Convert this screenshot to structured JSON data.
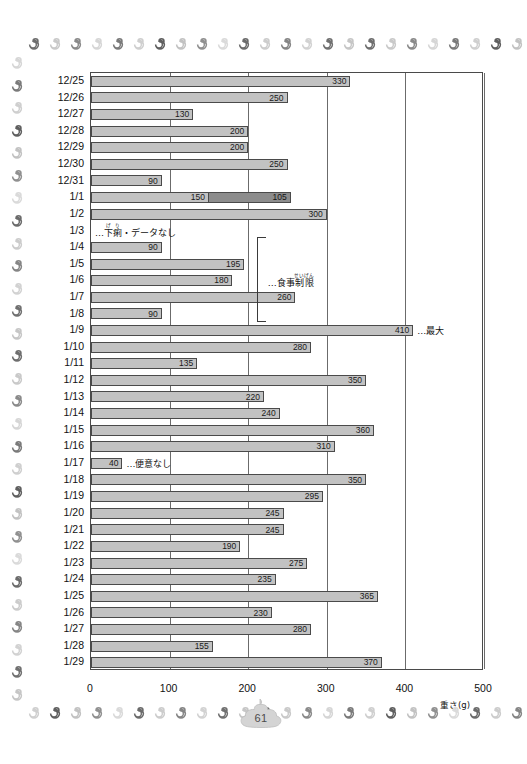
{
  "page": {
    "number": "61"
  },
  "chart_data": {
    "type": "bar",
    "orientation": "horizontal",
    "title": "",
    "xlabel": "重さ(g)",
    "ylabel": "",
    "xlim": [
      0,
      500
    ],
    "xticks": [
      0,
      100,
      200,
      300,
      400,
      500
    ],
    "xtick_labels": [
      "0",
      "100",
      "200",
      "300",
      "400",
      "500"
    ],
    "grid": "vertical",
    "legend": "none",
    "categories": [
      "12/25",
      "12/26",
      "12/27",
      "12/28",
      "12/29",
      "12/30",
      "12/31",
      "1/1",
      "1/2",
      "1/3",
      "1/4",
      "1/5",
      "1/6",
      "1/7",
      "1/8",
      "1/9",
      "1/10",
      "1/11",
      "1/12",
      "1/13",
      "1/14",
      "1/15",
      "1/16",
      "1/17",
      "1/18",
      "1/19",
      "1/20",
      "1/21",
      "1/22",
      "1/23",
      "1/24",
      "1/25",
      "1/26",
      "1/27",
      "1/28",
      "1/29"
    ],
    "values": [
      330,
      250,
      130,
      200,
      200,
      250,
      90,
      255,
      300,
      null,
      90,
      195,
      180,
      260,
      90,
      410,
      280,
      135,
      350,
      220,
      240,
      360,
      310,
      40,
      350,
      295,
      245,
      245,
      190,
      275,
      235,
      365,
      230,
      280,
      155,
      370
    ],
    "rows": [
      {
        "label": "12/25",
        "segments": [
          {
            "value": 330,
            "label": "330",
            "shade": "light"
          }
        ],
        "note": ""
      },
      {
        "label": "12/26",
        "segments": [
          {
            "value": 250,
            "label": "250",
            "shade": "light"
          }
        ],
        "note": ""
      },
      {
        "label": "12/27",
        "segments": [
          {
            "value": 130,
            "label": "130",
            "shade": "light"
          }
        ],
        "note": ""
      },
      {
        "label": "12/28",
        "segments": [
          {
            "value": 200,
            "label": "200",
            "shade": "light"
          }
        ],
        "note": ""
      },
      {
        "label": "12/29",
        "segments": [
          {
            "value": 200,
            "label": "200",
            "shade": "light"
          }
        ],
        "note": ""
      },
      {
        "label": "12/30",
        "segments": [
          {
            "value": 250,
            "label": "250",
            "shade": "light"
          }
        ],
        "note": ""
      },
      {
        "label": "12/31",
        "segments": [
          {
            "value": 90,
            "label": "90",
            "shade": "light"
          }
        ],
        "note": ""
      },
      {
        "label": "1/1",
        "segments": [
          {
            "value": 150,
            "label": "150",
            "shade": "light"
          },
          {
            "value": 105,
            "label": "105",
            "shade": "dark"
          }
        ],
        "note": ""
      },
      {
        "label": "1/2",
        "segments": [
          {
            "value": 300,
            "label": "300",
            "shade": "light"
          }
        ],
        "note": ""
      },
      {
        "label": "1/3",
        "segments": [],
        "note": "…下痢・データなし",
        "note_ruby_base": "下痢",
        "note_ruby_text": "げり"
      },
      {
        "label": "1/4",
        "segments": [
          {
            "value": 90,
            "label": "90",
            "shade": "light"
          }
        ],
        "note": ""
      },
      {
        "label": "1/5",
        "segments": [
          {
            "value": 195,
            "label": "195",
            "shade": "light"
          }
        ],
        "note": ""
      },
      {
        "label": "1/6",
        "segments": [
          {
            "value": 180,
            "label": "180",
            "shade": "light"
          }
        ],
        "note": ""
      },
      {
        "label": "1/7",
        "segments": [
          {
            "value": 260,
            "label": "260",
            "shade": "light"
          }
        ],
        "note": ""
      },
      {
        "label": "1/8",
        "segments": [
          {
            "value": 90,
            "label": "90",
            "shade": "light"
          }
        ],
        "note": ""
      },
      {
        "label": "1/9",
        "segments": [
          {
            "value": 410,
            "label": "410",
            "shade": "light"
          }
        ],
        "note": "…最大"
      },
      {
        "label": "1/10",
        "segments": [
          {
            "value": 280,
            "label": "280",
            "shade": "light"
          }
        ],
        "note": ""
      },
      {
        "label": "1/11",
        "segments": [
          {
            "value": 135,
            "label": "135",
            "shade": "light"
          }
        ],
        "note": ""
      },
      {
        "label": "1/12",
        "segments": [
          {
            "value": 350,
            "label": "350",
            "shade": "light"
          }
        ],
        "note": ""
      },
      {
        "label": "1/13",
        "segments": [
          {
            "value": 220,
            "label": "220",
            "shade": "light"
          }
        ],
        "note": ""
      },
      {
        "label": "1/14",
        "segments": [
          {
            "value": 240,
            "label": "240",
            "shade": "light"
          }
        ],
        "note": ""
      },
      {
        "label": "1/15",
        "segments": [
          {
            "value": 360,
            "label": "360",
            "shade": "light"
          }
        ],
        "note": ""
      },
      {
        "label": "1/16",
        "segments": [
          {
            "value": 310,
            "label": "310",
            "shade": "light"
          }
        ],
        "note": ""
      },
      {
        "label": "1/17",
        "segments": [
          {
            "value": 40,
            "label": "40",
            "shade": "light"
          }
        ],
        "note": "…便意なし"
      },
      {
        "label": "1/18",
        "segments": [
          {
            "value": 350,
            "label": "350",
            "shade": "light"
          }
        ],
        "note": ""
      },
      {
        "label": "1/19",
        "segments": [
          {
            "value": 295,
            "label": "295",
            "shade": "light"
          }
        ],
        "note": ""
      },
      {
        "label": "1/20",
        "segments": [
          {
            "value": 245,
            "label": "245",
            "shade": "light"
          }
        ],
        "note": ""
      },
      {
        "label": "1/21",
        "segments": [
          {
            "value": 245,
            "label": "245",
            "shade": "light"
          }
        ],
        "note": ""
      },
      {
        "label": "1/22",
        "segments": [
          {
            "value": 190,
            "label": "190",
            "shade": "light"
          }
        ],
        "note": ""
      },
      {
        "label": "1/23",
        "segments": [
          {
            "value": 275,
            "label": "275",
            "shade": "light"
          }
        ],
        "note": ""
      },
      {
        "label": "1/24",
        "segments": [
          {
            "value": 235,
            "label": "235",
            "shade": "light"
          }
        ],
        "note": ""
      },
      {
        "label": "1/25",
        "segments": [
          {
            "value": 365,
            "label": "365",
            "shade": "light"
          }
        ],
        "note": ""
      },
      {
        "label": "1/26",
        "segments": [
          {
            "value": 230,
            "label": "230",
            "shade": "light"
          }
        ],
        "note": ""
      },
      {
        "label": "1/27",
        "segments": [
          {
            "value": 280,
            "label": "280",
            "shade": "light"
          }
        ],
        "note": ""
      },
      {
        "label": "1/28",
        "segments": [
          {
            "value": 155,
            "label": "155",
            "shade": "light"
          }
        ],
        "note": ""
      },
      {
        "label": "1/29",
        "segments": [
          {
            "value": 370,
            "label": "370",
            "shade": "light"
          }
        ],
        "note": ""
      }
    ],
    "annotations": [
      {
        "name": "diet-restriction-bracket",
        "label": "…食事制限",
        "ruby_base": "制限",
        "ruby_text": "せいげん",
        "from_row": "1/4",
        "to_row": "1/8"
      },
      {
        "name": "max-callout",
        "label": "…最大",
        "row": "1/9"
      },
      {
        "name": "no-urge-callout",
        "label": "…便意なし",
        "row": "1/17"
      },
      {
        "name": "diarrhea-no-data-callout",
        "label": "…下痢・データなし",
        "ruby_base": "下痢",
        "ruby_text": "げり",
        "row": "1/3"
      }
    ],
    "colors": {
      "bar_light": "#c2c2c2",
      "bar_dark": "#8c8c8c",
      "bar_border": "#4a4a4a",
      "grid": "#6b6b6b"
    }
  }
}
